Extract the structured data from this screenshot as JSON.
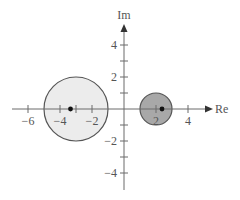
{
  "diagram": {
    "type": "complex-plane",
    "axes": {
      "x_label": "Re",
      "y_label": "Im",
      "x_ticks": [
        -6,
        -5,
        -4,
        -3,
        -2,
        2,
        4
      ],
      "x_tick_labels": [
        "−6",
        "−4",
        "−2",
        "2",
        "4"
      ],
      "y_ticks": [
        -5,
        -4,
        -3,
        -2,
        -1,
        1,
        2,
        3,
        4,
        5
      ],
      "y_tick_labels": [
        "4",
        "2",
        "−2",
        "−4"
      ],
      "x_range": [
        -7,
        5.5
      ],
      "y_range": [
        -5.5,
        6
      ]
    },
    "circles": [
      {
        "name": "left-disk",
        "center": [
          -3,
          0
        ],
        "radius": 2,
        "fill": "#ececec",
        "stroke": "#555555",
        "point": [
          -3.33,
          0
        ]
      },
      {
        "name": "right-disk",
        "center": [
          2,
          0
        ],
        "radius": 1,
        "fill": "#a8a8a8",
        "stroke": "#555555",
        "point": [
          2.4,
          0
        ]
      }
    ],
    "colors": {
      "axis": "#6a6a6a",
      "point": "#111111"
    }
  }
}
